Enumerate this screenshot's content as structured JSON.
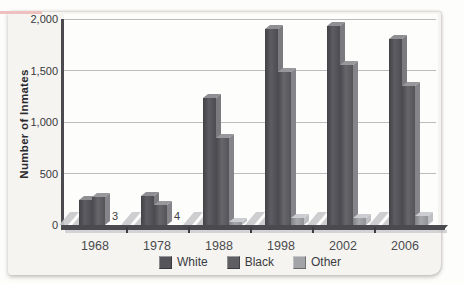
{
  "chart_data": {
    "type": "bar",
    "style_3d": true,
    "title": "",
    "xlabel": "",
    "ylabel": "Number of Inmates",
    "categories": [
      "1968",
      "1978",
      "1988",
      "1998",
      "2002",
      "2006"
    ],
    "series": [
      {
        "name": "White",
        "values": [
          243,
          281,
          1235,
          1906,
          1931,
          1802
        ],
        "colors": {
          "front": "#54545a",
          "side": "#7a7a7f",
          "top": "#8e8e93"
        }
      },
      {
        "name": "Black",
        "values": [
          271,
          197,
          845,
          1486,
          1554,
          1352
        ],
        "colors": {
          "front": "#5e5e63",
          "side": "#84848a",
          "top": "#97979c"
        }
      },
      {
        "name": "Other",
        "values": [
          3,
          4,
          30,
          66,
          72,
          83
        ],
        "colors": {
          "front": "#a3a4a8",
          "side": "#bfc0c4",
          "top": "#cccdd1"
        }
      }
    ],
    "annotations": [
      {
        "category_index": 0,
        "series": "Other",
        "text": "3"
      },
      {
        "category_index": 1,
        "series": "Other",
        "text": "4"
      }
    ],
    "ylim": [
      0,
      2000
    ],
    "yticks": [
      0,
      500,
      1000,
      1500,
      2000
    ],
    "ytick_labels": [
      "0",
      "500",
      "1,000",
      "1,500",
      "2,000"
    ],
    "grid": true,
    "legend_position": "bottom",
    "style": {
      "grid_color": "#bcbcbf",
      "axis_color": "#4b4b4f",
      "plot_bg": "#fdfdfc",
      "card_bg": "#f5f4f1",
      "page_bg": "#fdfdfc",
      "bar_shadow_color": "#c9c9cc",
      "accent_pink": "#eec0c0"
    }
  }
}
